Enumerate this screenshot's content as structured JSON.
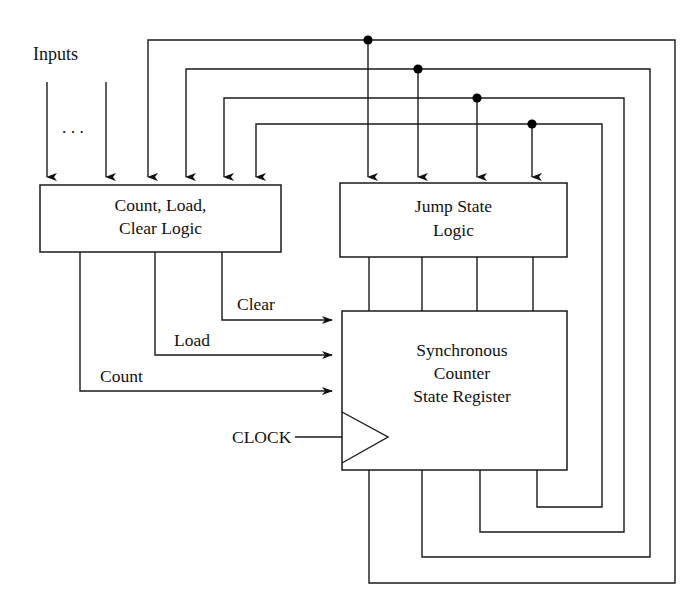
{
  "figure": {
    "caption": "",
    "background_color": "#ffffff",
    "line_color": "#1a1a1a"
  },
  "labels": {
    "inputs": "Inputs",
    "ellipsis": ". . .",
    "clock": "CLOCK",
    "clear": "Clear",
    "load": "Load",
    "count": "Count"
  },
  "blocks": [
    {
      "id": "count-load-clear-logic",
      "lines": [
        "Count, Load,",
        "Clear Logic"
      ],
      "x": 40,
      "y": 185,
      "w": 241,
      "h": 67
    },
    {
      "id": "jump-state-logic",
      "lines": [
        "Jump State",
        "Logic"
      ],
      "x": 340,
      "y": 183,
      "w": 227,
      "h": 74
    },
    {
      "id": "synchronous-counter-state-register",
      "lines": [
        "Synchronous",
        "Counter",
        "State Register"
      ],
      "x": 342,
      "y": 311,
      "w": 225,
      "h": 159
    }
  ],
  "signals": {
    "clear": {
      "label": "Clear",
      "x": 238,
      "y": 310
    },
    "load": {
      "label": "Load",
      "x": 174,
      "y": 345
    },
    "count": {
      "label": "Count",
      "x": 100,
      "y": 381
    }
  },
  "feedback_loops": [
    {
      "index": 1,
      "top_y": 40,
      "right_x": 675,
      "bottom_y": 583,
      "left_x": 148,
      "jump_x": 368,
      "reg_out_x": 369
    },
    {
      "index": 2,
      "top_y": 69,
      "right_x": 650,
      "bottom_y": 557,
      "left_x": 186,
      "jump_x": 418,
      "reg_out_x": 422
    },
    {
      "index": 3,
      "top_y": 98,
      "right_x": 624,
      "bottom_y": 532,
      "left_x": 224,
      "jump_x": 477,
      "reg_out_x": 480
    },
    {
      "index": 4,
      "top_y": 124,
      "right_x": 602,
      "bottom_y": 507,
      "left_x": 256,
      "jump_x": 532,
      "reg_out_x": 537
    }
  ],
  "external_inputs": [
    {
      "x": 47,
      "top_y": 82
    },
    {
      "x": 106,
      "top_y": 82
    }
  ],
  "clock": {
    "label": "CLOCK",
    "label_x": 232,
    "label_y": 392,
    "wire_y": 437,
    "wire_from_x": 295,
    "wire_to_x": 342
  },
  "jump_to_register_wires": [
    369,
    422,
    477,
    533
  ]
}
